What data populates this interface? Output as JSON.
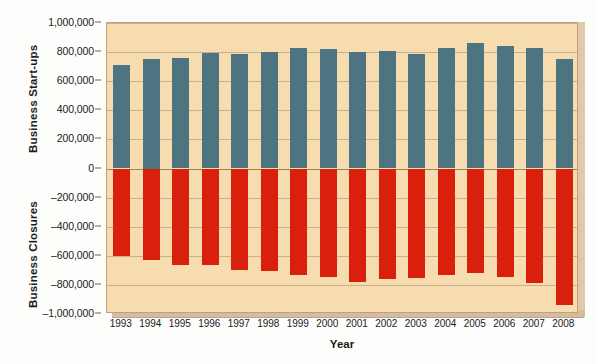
{
  "chart_data": {
    "type": "bar",
    "title": "",
    "subtitle": "",
    "xlabel": "Year",
    "ylabel_positive": "Business Start-ups",
    "ylabel_negative": "Business Closures",
    "grid": true,
    "legend": "none",
    "ylim": [
      -1000000,
      1000000
    ],
    "ytick_labels": [
      "1,000,000",
      "800,000",
      "600,000",
      "400,000",
      "200,000",
      "0",
      "–200,000",
      "–400,000",
      "–600,000",
      "–800,000",
      "–1,000,000"
    ],
    "ytick_values": [
      1000000,
      800000,
      600000,
      400000,
      200000,
      0,
      -200000,
      -400000,
      -600000,
      -800000,
      -1000000
    ],
    "categories": [
      "1993",
      "1994",
      "1995",
      "1996",
      "1997",
      "1998",
      "1999",
      "2000",
      "2001",
      "2002",
      "2003",
      "2004",
      "2005",
      "2006",
      "2007",
      "2008"
    ],
    "series": [
      {
        "name": "Business Start-ups",
        "color": "#4d7480",
        "values": [
          710000,
          750000,
          760000,
          795000,
          790000,
          800000,
          825000,
          820000,
          800000,
          805000,
          790000,
          830000,
          860000,
          845000,
          830000,
          755000
        ]
      },
      {
        "name": "Business Closures",
        "color": "#d8200d",
        "values": [
          -600000,
          -630000,
          -660000,
          -665000,
          -700000,
          -705000,
          -735000,
          -745000,
          -780000,
          -760000,
          -755000,
          -735000,
          -720000,
          -745000,
          -785000,
          -940000
        ]
      }
    ]
  },
  "axis": {
    "x_title": "Year",
    "y_title_top": "Business Start-ups",
    "y_title_bottom": "Business Closures"
  },
  "colors": {
    "plot_background": "#f6dcae",
    "startups_bar": "#4d7480",
    "closures_bar": "#d8200d",
    "gridline": "#b9a182",
    "page_background": "#fdfdfb",
    "text": "#1b1b1b"
  }
}
